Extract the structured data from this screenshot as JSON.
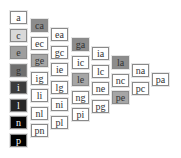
{
  "header_text_partial": "· · · · · · · · · · · · · · · · · · ·",
  "columns": [
    {
      "x": 10,
      "y0": 11,
      "cells": [
        {
          "label": "a",
          "fill": "#ffffff"
        },
        {
          "label": "c",
          "fill": "#d9d9d9"
        },
        {
          "label": "e",
          "fill": "#9e9e9e"
        },
        {
          "label": "g",
          "fill": "#707070"
        },
        {
          "label": "i",
          "fill": "#3c3c3c"
        },
        {
          "label": "l",
          "fill": "#262626"
        },
        {
          "label": "n",
          "fill": "#050505"
        },
        {
          "label": "p",
          "fill": "#000000"
        }
      ]
    },
    {
      "x": 31,
      "y0": 19,
      "cells": [
        {
          "label": "ca",
          "fill": "#8c8c8c"
        },
        {
          "label": "ec",
          "fill": "#ffffff"
        },
        {
          "label": "ge",
          "fill": "#a6a6a6"
        },
        {
          "label": "ig",
          "fill": "#ffffff"
        },
        {
          "label": "li",
          "fill": "#ffffff"
        },
        {
          "label": "nl",
          "fill": "#ffffff"
        },
        {
          "label": "pn",
          "fill": "#ffffff"
        }
      ]
    },
    {
      "x": 51,
      "y0": 28,
      "cells": [
        {
          "label": "ea",
          "fill": "#ffffff"
        },
        {
          "label": "gc",
          "fill": "#ffffff"
        },
        {
          "label": "ie",
          "fill": "#ffffff"
        },
        {
          "label": "lg",
          "fill": "#ffffff"
        },
        {
          "label": "ni",
          "fill": "#ffffff"
        },
        {
          "label": "pl",
          "fill": "#ffffff"
        }
      ]
    },
    {
      "x": 72,
      "y0": 38,
      "cells": [
        {
          "label": "ga",
          "fill": "#8c8c8c"
        },
        {
          "label": "ic",
          "fill": "#ffffff"
        },
        {
          "label": "le",
          "fill": "#a6a6a6"
        },
        {
          "label": "ng",
          "fill": "#ffffff"
        },
        {
          "label": "pi",
          "fill": "#ffffff"
        }
      ]
    },
    {
      "x": 92,
      "y0": 47,
      "cells": [
        {
          "label": "ia",
          "fill": "#ffffff"
        },
        {
          "label": "lc",
          "fill": "#ffffff"
        },
        {
          "label": "ne",
          "fill": "#ffffff"
        },
        {
          "label": "pg",
          "fill": "#ffffff"
        }
      ]
    },
    {
      "x": 112,
      "y0": 56,
      "cells": [
        {
          "label": "la",
          "fill": "#8c8c8c"
        },
        {
          "label": "nc",
          "fill": "#ffffff"
        },
        {
          "label": "pe",
          "fill": "#a6a6a6"
        }
      ]
    },
    {
      "x": 132,
      "y0": 64,
      "cells": [
        {
          "label": "na",
          "fill": "#ffffff"
        },
        {
          "label": "pc",
          "fill": "#ffffff"
        }
      ]
    },
    {
      "x": 152,
      "y0": 73,
      "cells": [
        {
          "label": "pa",
          "fill": "#ffffff"
        }
      ]
    }
  ],
  "row_step": 17.5
}
